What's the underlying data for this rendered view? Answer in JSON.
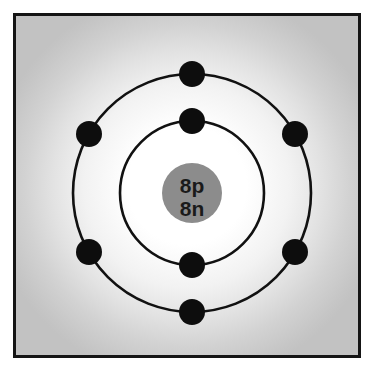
{
  "diagram": {
    "frame": {
      "border_color": "#151515",
      "background_center_color": "#ffffff",
      "background_edge_color": "#c6c6c6"
    },
    "nucleus": {
      "label_protons": "8p",
      "label_neutrons": "8n",
      "fill_color": "#8c8c8c",
      "text_color": "#1a1a1a",
      "center_x": 176,
      "center_y": 177,
      "radius": 30
    },
    "shells": [
      {
        "name": "inner-shell",
        "radius": 72,
        "electron_count": 2,
        "stroke_color": "#111111",
        "electron_angles_deg": [
          270,
          90
        ]
      },
      {
        "name": "outer-shell",
        "radius": 119,
        "electron_count": 6,
        "stroke_color": "#111111",
        "electron_angles_deg": [
          270,
          330,
          30,
          90,
          150,
          210
        ]
      }
    ],
    "electron": {
      "radius": 13,
      "fill_color": "#0d0d0d"
    },
    "electrons": [
      {
        "shell": "inner-shell",
        "x": 176,
        "y": 105
      },
      {
        "shell": "inner-shell",
        "x": 176,
        "y": 249
      },
      {
        "shell": "outer-shell",
        "x": 176,
        "y": 58
      },
      {
        "shell": "outer-shell",
        "x": 279,
        "y": 118
      },
      {
        "shell": "outer-shell",
        "x": 279,
        "y": 236
      },
      {
        "shell": "outer-shell",
        "x": 176,
        "y": 296
      },
      {
        "shell": "outer-shell",
        "x": 73,
        "y": 236
      },
      {
        "shell": "outer-shell",
        "x": 73,
        "y": 118
      }
    ]
  }
}
